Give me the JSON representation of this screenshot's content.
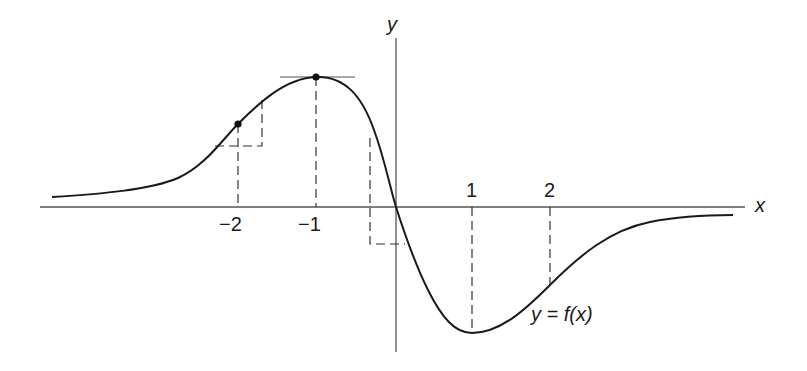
{
  "diagram": {
    "axis_labels": {
      "x": "x",
      "y": "y"
    },
    "tick_labels": [
      {
        "value": -2,
        "label": "−2"
      },
      {
        "value": -1,
        "label": "−1"
      },
      {
        "value": 1,
        "label": "1"
      },
      {
        "value": 2,
        "label": "2"
      }
    ],
    "curve_label": "y = f(x)",
    "marked_points": [
      {
        "name": "point-at-x-minus-2",
        "x": -2
      },
      {
        "name": "maximum-at-x-minus-1",
        "x": -1
      }
    ],
    "annotations": [
      "horizontal tangent at maximum x = -1",
      "dashed slope triangle at x = -2",
      "dashed slope triangle near origin",
      "dashed drop lines at x = -2, -1, 1, 2",
      "minimum at x = 1"
    ],
    "colors": {
      "line": "#1a1a1a",
      "axis": "#555555",
      "background": "#ffffff"
    }
  }
}
